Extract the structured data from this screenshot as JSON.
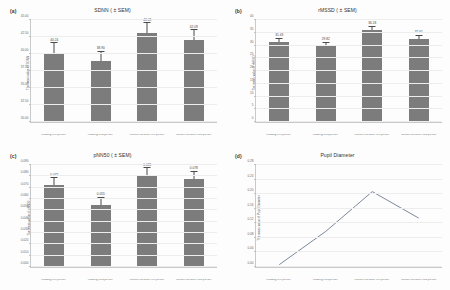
{
  "figure": {
    "background": "#ffffff",
    "bar_color": "#7c7c7c",
    "error_color": "#4a4a4a",
    "line_color": "#5a6b80",
    "grid_color": "#ededed"
  },
  "categories": [
    "Reading first person",
    "Reading third person",
    "Custom literature first person",
    "Custom literature third person"
  ],
  "chart_data": [
    {
      "type": "bar",
      "panel": "(a)",
      "title": "SDNN ( ± SEM)",
      "xlabel": "",
      "ylabel": "The mean value of SDNN",
      "categories": [
        "Reading first person",
        "Reading third person",
        "Custom literature first person",
        "Custom literature third person"
      ],
      "values": [
        40.2,
        38.9,
        43.1,
        42.1
      ],
      "errors": [
        0.9,
        0.9,
        0.9,
        0.9
      ],
      "data_labels": [
        "40.24",
        "38.90",
        "43.08",
        "42.09"
      ],
      "ylim": [
        30.0,
        45.0
      ],
      "yticks": [
        30.0,
        32.5,
        35.0,
        37.5,
        40.0,
        42.5,
        45.0
      ],
      "ytick_labels": [
        "30.00",
        "32.50",
        "35.00",
        "37.50",
        "40.00",
        "42.50",
        "45.00"
      ],
      "grid": true,
      "legend": "none"
    },
    {
      "type": "bar",
      "panel": "(b)",
      "title": "rMSSD ( ± SEM)",
      "xlabel": "",
      "ylabel": "The mean value of rMSSD",
      "categories": [
        "Reading first person",
        "Reading third person",
        "Custom literature first person",
        "Custom literature third person"
      ],
      "values": [
        31.4,
        29.8,
        36.2,
        32.6
      ],
      "errors": [
        0.8,
        0.8,
        0.8,
        0.8
      ],
      "data_labels": [
        "31.43",
        "29.82",
        "36.18",
        "32.61"
      ],
      "ylim": [
        0,
        40
      ],
      "yticks": [
        0,
        5,
        10,
        15,
        20,
        25,
        30,
        35,
        40
      ],
      "ytick_labels": [
        "0",
        "5",
        "10",
        "15",
        "20",
        "25",
        "30",
        "35",
        "40"
      ],
      "grid": true,
      "legend": "none"
    },
    {
      "type": "bar",
      "panel": "(c)",
      "title": "pNN50 ( ± SEM)",
      "xlabel": "",
      "ylabel": "The mean value of pNN50",
      "categories": [
        "Reading first person",
        "Reading third person",
        "Custom literature first person",
        "Custom literature third person"
      ],
      "values": [
        0.072,
        0.055,
        0.081,
        0.078
      ],
      "errors": [
        0.004,
        0.004,
        0.004,
        0.004
      ],
      "data_labels": [
        "0.072",
        "0.055",
        "0.081",
        "0.078"
      ],
      "ylim": [
        0.0,
        0.09
      ],
      "yticks": [
        0.0,
        0.01,
        0.02,
        0.03,
        0.04,
        0.05,
        0.06,
        0.07,
        0.08,
        0.09
      ],
      "ytick_labels": [
        "0.000",
        "0.010",
        "0.020",
        "0.030",
        "0.040",
        "0.050",
        "0.060",
        "0.070",
        "0.080",
        "0.090"
      ],
      "grid": true,
      "legend": "none"
    },
    {
      "type": "line",
      "panel": "(d)",
      "title": "Pupil Diameter",
      "xlabel": "",
      "ylabel": "The mean value of Pupil Diameter",
      "categories": [
        "Reading first person",
        "Reading third person",
        "Custom literature first person",
        "Custom literature third person"
      ],
      "x": [
        0,
        1,
        2,
        3
      ],
      "values": [
        0.13,
        0.18,
        0.24,
        0.2
      ],
      "ylim": [
        0.0,
        0.28
      ],
      "yticks": [
        0.0,
        0.04,
        0.08,
        0.12,
        0.16,
        0.2,
        0.24,
        0.28
      ],
      "ytick_labels": [
        "0.00",
        "0.04",
        "0.08",
        "0.12",
        "0.16",
        "0.20",
        "0.24",
        "0.28"
      ],
      "grid": true,
      "legend": "none"
    }
  ]
}
